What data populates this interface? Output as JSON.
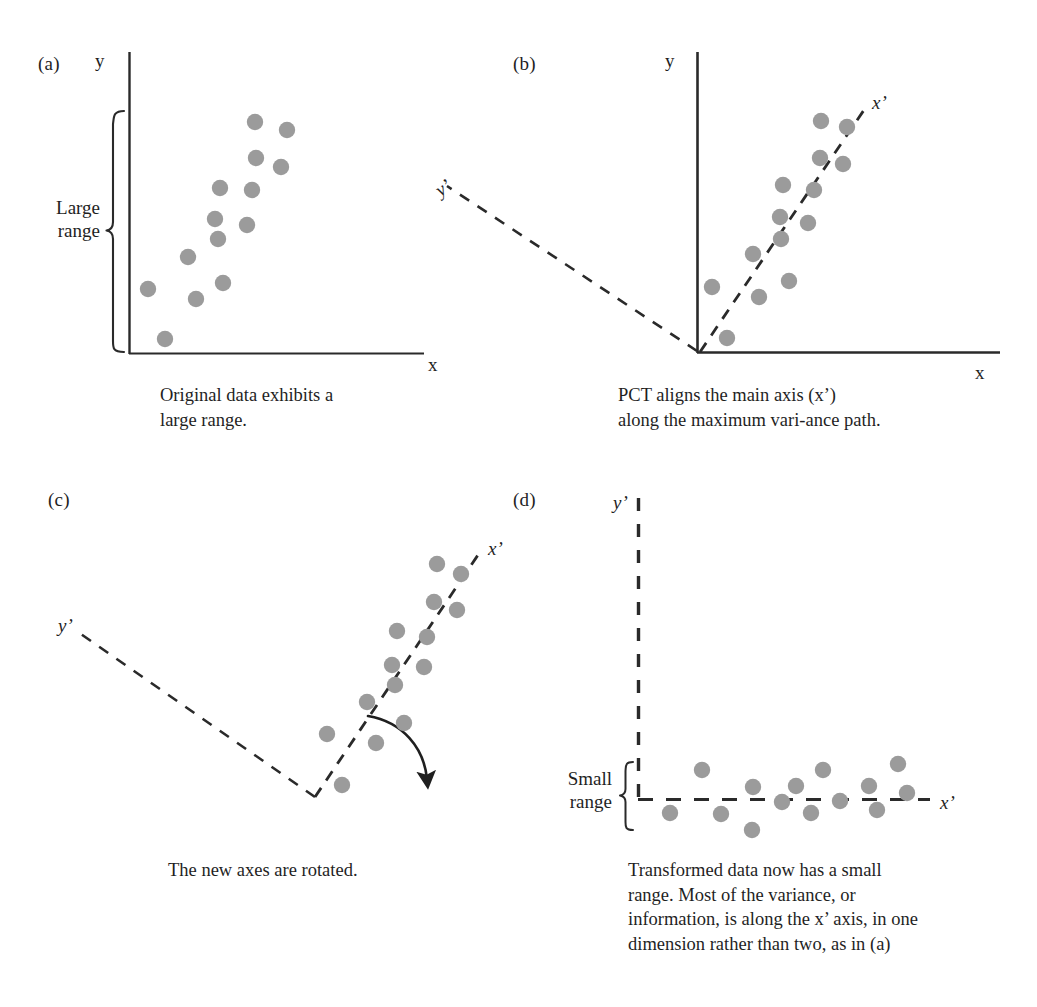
{
  "figure": {
    "dot_color": "#9b9b9b",
    "ink_color": "#1f1f1f",
    "background": "#ffffff"
  },
  "panels": [
    {
      "id": "a",
      "label": "(a)",
      "caption": "Original data exhibits a\nlarge range.",
      "caption_line1": "Original data exhibits a",
      "caption_line2": "large range.",
      "axes": {
        "y_label": "y",
        "x_label": "x"
      },
      "annotation": {
        "brace_label_line1": "Large",
        "brace_label_line2": "range"
      }
    },
    {
      "id": "b",
      "label": "(b)",
      "caption_line1": "PCT aligns the main axis (x’)",
      "caption_line2": "along the maximum vari-ance path.",
      "axes": {
        "y_label": "y",
        "x_label": "x",
        "xprime_label": "x’",
        "yprime_label": "y’"
      }
    },
    {
      "id": "c",
      "label": "(c)",
      "caption_line1": "The new axes are rotated.",
      "axes": {
        "xprime_label": "x’",
        "yprime_label": "y’"
      },
      "annotation": {
        "rotation_arrow": "curved-rotation-arrow"
      }
    },
    {
      "id": "d",
      "label": "(d)",
      "caption_line1": "Transformed data now has a small",
      "caption_line2": "range. Most of the variance, or",
      "caption_line3": "information, is along the x’ axis, in one",
      "caption_line4": "dimension rather than two, as in (a)",
      "axes": {
        "xprime_label": "x’",
        "yprime_label": "y’"
      },
      "annotation": {
        "brace_label_line1": "Small",
        "brace_label_line2": "range"
      }
    }
  ],
  "chart_data": [
    {
      "type": "scatter",
      "panel": "a",
      "title": "Original data exhibits a large range.",
      "xlabel": "x",
      "ylabel": "y",
      "axis_style": "solid",
      "grid": false,
      "legend": "none",
      "annotations": [
        "Large range brace spanning the full y extent of the data"
      ],
      "points": [
        {
          "x": 255,
          "y": 122
        },
        {
          "x": 287,
          "y": 130
        },
        {
          "x": 256,
          "y": 158
        },
        {
          "x": 281,
          "y": 167
        },
        {
          "x": 220,
          "y": 188
        },
        {
          "x": 252,
          "y": 190
        },
        {
          "x": 215,
          "y": 219
        },
        {
          "x": 247,
          "y": 225
        },
        {
          "x": 218,
          "y": 239
        },
        {
          "x": 188,
          "y": 257
        },
        {
          "x": 223,
          "y": 283
        },
        {
          "x": 148,
          "y": 289
        },
        {
          "x": 196,
          "y": 299
        },
        {
          "x": 165,
          "y": 339
        }
      ]
    },
    {
      "type": "scatter",
      "panel": "b",
      "title": "PCT aligns the main axis (x’) along the maximum vari-ance path.",
      "xlabel": "x",
      "ylabel": "y",
      "axis_style": "solid, with dashed x’ and y’ principal axes",
      "grid": false,
      "legend": "none",
      "annotations": [
        "x’ dashed principal axis through the data",
        "y’ dashed axis orthogonal to x’"
      ],
      "points": [
        {
          "x": 821,
          "y": 121
        },
        {
          "x": 847,
          "y": 127
        },
        {
          "x": 820,
          "y": 158
        },
        {
          "x": 843,
          "y": 164
        },
        {
          "x": 783,
          "y": 185
        },
        {
          "x": 814,
          "y": 190
        },
        {
          "x": 780,
          "y": 217
        },
        {
          "x": 808,
          "y": 223
        },
        {
          "x": 781,
          "y": 239
        },
        {
          "x": 753,
          "y": 254
        },
        {
          "x": 789,
          "y": 281
        },
        {
          "x": 712,
          "y": 287
        },
        {
          "x": 759,
          "y": 297
        },
        {
          "x": 727,
          "y": 338
        }
      ]
    },
    {
      "type": "scatter",
      "panel": "c",
      "title": "The new axes are rotated.",
      "xlabel": "x’",
      "ylabel": "y’",
      "axis_style": "dashed rotated axes only",
      "grid": false,
      "legend": "none",
      "annotations": [
        "curved arrow showing rotation direction"
      ],
      "points": [
        {
          "x": 437,
          "y": 564
        },
        {
          "x": 461,
          "y": 574
        },
        {
          "x": 434,
          "y": 602
        },
        {
          "x": 457,
          "y": 610
        },
        {
          "x": 397,
          "y": 631
        },
        {
          "x": 427,
          "y": 637
        },
        {
          "x": 392,
          "y": 665
        },
        {
          "x": 424,
          "y": 667
        },
        {
          "x": 395,
          "y": 685
        },
        {
          "x": 367,
          "y": 702
        },
        {
          "x": 404,
          "y": 723
        },
        {
          "x": 327,
          "y": 734
        },
        {
          "x": 376,
          "y": 743
        },
        {
          "x": 342,
          "y": 785
        }
      ]
    },
    {
      "type": "scatter",
      "panel": "d",
      "title": "Transformed data now has a small range.",
      "xlabel": "x’",
      "ylabel": "y’",
      "axis_style": "dashed axes",
      "grid": false,
      "legend": "none",
      "annotations": [
        "Small range brace spanning the compressed y’ extent"
      ],
      "points": [
        {
          "x": 670,
          "y": 813
        },
        {
          "x": 702,
          "y": 770
        },
        {
          "x": 721,
          "y": 814
        },
        {
          "x": 752,
          "y": 830
        },
        {
          "x": 753,
          "y": 787
        },
        {
          "x": 782,
          "y": 802
        },
        {
          "x": 796,
          "y": 786
        },
        {
          "x": 811,
          "y": 813
        },
        {
          "x": 823,
          "y": 770
        },
        {
          "x": 840,
          "y": 801
        },
        {
          "x": 869,
          "y": 786
        },
        {
          "x": 877,
          "y": 810
        },
        {
          "x": 898,
          "y": 764
        },
        {
          "x": 907,
          "y": 793
        }
      ]
    }
  ]
}
